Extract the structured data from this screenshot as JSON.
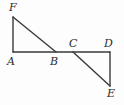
{
  "figure": {
    "background_color": "#fdfdfd",
    "stroke_color": "#3a3a3a",
    "label_color": "#2b2b2b",
    "stroke_width": 1.4,
    "labels": {
      "F": "F",
      "A": "A",
      "B": "B",
      "C": "C",
      "D": "D",
      "E": "E"
    },
    "points": {
      "F": {
        "x": 13,
        "y": 17
      },
      "A": {
        "x": 13,
        "y": 52
      },
      "B": {
        "x": 56,
        "y": 52
      },
      "C": {
        "x": 73,
        "y": 52
      },
      "D": {
        "x": 110,
        "y": 52
      },
      "E": {
        "x": 110,
        "y": 86
      }
    },
    "segments": [
      {
        "name": "segment-FA",
        "from": "F",
        "to": "A"
      },
      {
        "name": "segment-FB",
        "from": "F",
        "to": "B"
      },
      {
        "name": "segment-AD",
        "from": "A",
        "to": "D"
      },
      {
        "name": "segment-CE",
        "from": "C",
        "to": "E"
      },
      {
        "name": "segment-DE",
        "from": "D",
        "to": "E"
      }
    ]
  }
}
